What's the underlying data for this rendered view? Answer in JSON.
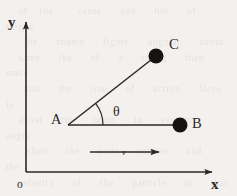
{
  "figure": {
    "kind": "physics-vector-diagram",
    "width": 237,
    "height": 196,
    "background_color": "#f3f1ee",
    "ink_color": "#2b2724"
  },
  "axes": {
    "y_label": "y",
    "x_label": "x",
    "origin_label": "o",
    "y_axis": {
      "x": 26,
      "y_top": 17,
      "y_bottom": 172
    },
    "x_axis": {
      "y": 172,
      "x_left": 26,
      "x_right": 217
    }
  },
  "points": [
    {
      "id": "A",
      "label": "A",
      "x": 68,
      "y": 125,
      "marker": "none",
      "label_x": 52,
      "label_y": 123
    },
    {
      "id": "B",
      "label": "B",
      "x": 180,
      "y": 125,
      "marker": "filled-circle",
      "radius": 7.5,
      "label_x": 192,
      "label_y": 127
    },
    {
      "id": "C",
      "label": "C",
      "x": 156,
      "y": 56,
      "marker": "filled-circle",
      "radius": 7.5,
      "label_x": 169,
      "label_y": 48
    }
  ],
  "segments": [
    {
      "id": "AB",
      "from": "A",
      "to": "B",
      "x1": 68,
      "y1": 125,
      "x2": 180,
      "y2": 125
    },
    {
      "id": "AC",
      "from": "A",
      "to": "C",
      "x1": 68,
      "y1": 125,
      "x2": 156,
      "y2": 56
    }
  ],
  "angle": {
    "label": "θ",
    "vertex": "A",
    "between": [
      "AB",
      "AC"
    ],
    "degrees": 38,
    "arc_radius": 35,
    "label_x": 113,
    "label_y": 115
  },
  "velocity_vector": {
    "label": "v",
    "x_start": 90,
    "x_end": 167,
    "y": 152,
    "direction": "right",
    "label_x": 125,
    "label_y": 154
  },
  "bleed_text": "  of  the    cause   and   hot   of   torque\n   the   shown   figure   angular   about\n  same   the   of   a   string   then   mass\n   and   the   line   of   action   force   is\n  about   the   point   in   system   angle\n   when   the   body   rotates   and   the\n  velocity   of   the   particle   at   that\n"
}
